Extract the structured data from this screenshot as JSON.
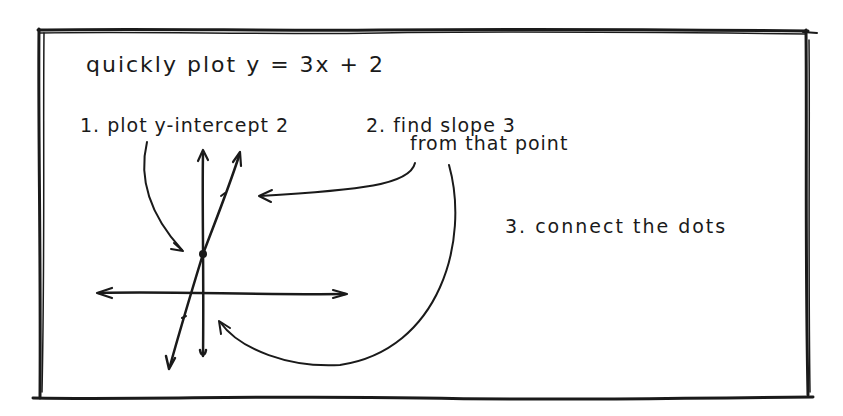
{
  "title": "quickly plot  y = 3x + 2",
  "steps": [
    {
      "label": "1. plot y-intercept 2"
    },
    {
      "label_line1": "2. find slope 3",
      "label_line2": "from that point"
    },
    {
      "label": "3. connect the dots"
    }
  ],
  "graph": {
    "equation": "y = 3x + 2",
    "slope": 3,
    "y_intercept": 2,
    "axes": [
      "x-axis",
      "y-axis"
    ],
    "annotations": [
      "arrow-to-intercept",
      "arrow-slope-from-point",
      "arrow-connect-dots"
    ]
  },
  "colors": {
    "ink": "#1a1a1a",
    "paper": "#ffffff"
  }
}
